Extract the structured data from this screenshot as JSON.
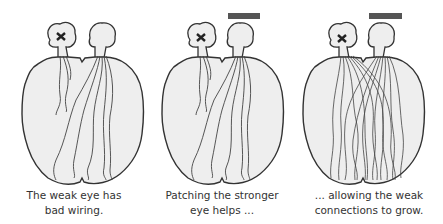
{
  "panels": [
    {
      "id": "weak-eye",
      "caption": [
        "The weak eye has",
        "bad wiring."
      ],
      "left_eye_marker": "x",
      "patch": false,
      "wiring": "few"
    },
    {
      "id": "patching",
      "caption": [
        "Patching the stronger",
        "eye helps ..."
      ],
      "left_eye_marker": "x",
      "patch": true,
      "wiring": "few"
    },
    {
      "id": "growth",
      "caption": [
        "... allowing the weak",
        "connections to grow."
      ],
      "left_eye_marker": "x",
      "patch": true,
      "wiring": "many"
    }
  ],
  "colors": {
    "brain_fill": "#eeeeee",
    "outline": "#333333",
    "patch": "#555555",
    "text": "#333333"
  }
}
